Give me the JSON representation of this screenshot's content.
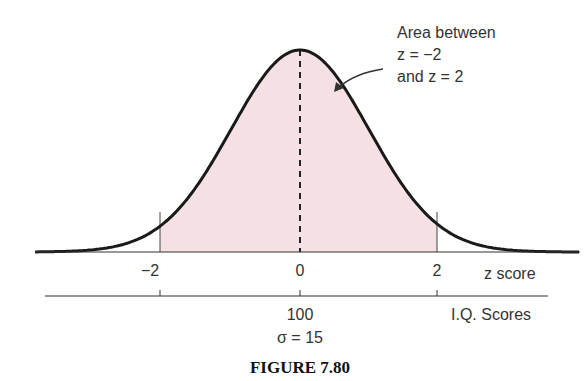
{
  "figure": {
    "caption": "FIGURE 7.80",
    "annotation": {
      "line1": "Area between",
      "line2": "z = −2",
      "line3": "and z = 2"
    },
    "z_axis": {
      "label": "z score",
      "ticks": [
        "−2",
        "0",
        "2"
      ]
    },
    "iq_axis": {
      "label": "I.Q. Scores",
      "center": "100",
      "sigma": "σ = 15"
    },
    "colors": {
      "shade": "#f5e1e4",
      "curve": "#1a1a1a"
    }
  }
}
